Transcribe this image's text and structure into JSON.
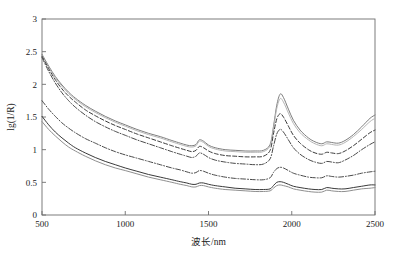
{
  "figure": {
    "background_color": "#ffffff",
    "axis_color": "#6e6e6e",
    "text_color": "#1b1b1b"
  },
  "chart_data": {
    "type": "line",
    "title": "",
    "subtitle": "",
    "xlabel": "波长/nm",
    "ylabel": "lg(1/R)",
    "xlim": [
      500,
      2500
    ],
    "ylim": [
      0,
      3
    ],
    "xticks": [
      500,
      1000,
      1500,
      2000,
      2500
    ],
    "xtick_labels": [
      "500",
      "1000",
      "1500",
      "2000",
      "2500"
    ],
    "yticks": [
      0,
      0.5,
      1,
      1.5,
      2,
      2.5,
      3
    ],
    "ytick_labels": [
      "0",
      "0.5",
      "1",
      "1.5",
      "2",
      "2.5",
      "3"
    ],
    "grid": false,
    "legend": null,
    "legend_position": "none",
    "annotations": [],
    "x": [
      500,
      540,
      580,
      620,
      660,
      700,
      760,
      820,
      880,
      940,
      1000,
      1070,
      1140,
      1210,
      1280,
      1330,
      1370,
      1400,
      1425,
      1445,
      1470,
      1500,
      1540,
      1600,
      1660,
      1720,
      1780,
      1830,
      1870,
      1890,
      1910,
      1930,
      1950,
      1980,
      2010,
      2050,
      2100,
      2140,
      2180,
      2210,
      2240,
      2280,
      2320,
      2370,
      2420,
      2470,
      2500
    ],
    "series": [
      {
        "name": "spectrum-1",
        "linestyle": "solid",
        "color": "#7d7d7d",
        "width": 1.0,
        "values": [
          2.46,
          2.28,
          2.12,
          1.99,
          1.88,
          1.79,
          1.68,
          1.59,
          1.51,
          1.44,
          1.38,
          1.31,
          1.25,
          1.2,
          1.14,
          1.1,
          1.07,
          1.06,
          1.08,
          1.15,
          1.13,
          1.07,
          1.03,
          1.0,
          0.99,
          0.98,
          0.98,
          0.99,
          1.08,
          1.35,
          1.68,
          1.85,
          1.8,
          1.62,
          1.45,
          1.3,
          1.18,
          1.12,
          1.09,
          1.12,
          1.11,
          1.1,
          1.14,
          1.23,
          1.35,
          1.48,
          1.53
        ]
      },
      {
        "name": "spectrum-2",
        "linestyle": "solid",
        "color": "#b6b6b6",
        "width": 1.0,
        "values": [
          2.44,
          2.26,
          2.1,
          1.97,
          1.86,
          1.77,
          1.66,
          1.57,
          1.49,
          1.42,
          1.36,
          1.29,
          1.23,
          1.18,
          1.12,
          1.08,
          1.05,
          1.04,
          1.06,
          1.13,
          1.11,
          1.05,
          1.01,
          0.98,
          0.97,
          0.96,
          0.96,
          0.97,
          1.06,
          1.32,
          1.63,
          1.78,
          1.73,
          1.56,
          1.4,
          1.26,
          1.15,
          1.09,
          1.06,
          1.09,
          1.08,
          1.07,
          1.11,
          1.2,
          1.31,
          1.43,
          1.48
        ]
      },
      {
        "name": "spectrum-3",
        "linestyle": "dashed",
        "color": "#3a3a3a",
        "width": 1.0,
        "values": [
          2.43,
          2.24,
          2.07,
          1.93,
          1.82,
          1.73,
          1.61,
          1.52,
          1.44,
          1.37,
          1.31,
          1.24,
          1.18,
          1.12,
          1.06,
          1.02,
          0.99,
          0.97,
          0.99,
          1.05,
          1.03,
          0.98,
          0.94,
          0.91,
          0.9,
          0.89,
          0.89,
          0.9,
          0.99,
          1.24,
          1.47,
          1.55,
          1.5,
          1.36,
          1.22,
          1.1,
          1.0,
          0.95,
          0.93,
          0.96,
          0.95,
          0.94,
          0.98,
          1.06,
          1.16,
          1.26,
          1.3
        ]
      },
      {
        "name": "spectrum-4",
        "linestyle": "dashdot",
        "color": "#4a4a4a",
        "width": 1.0,
        "values": [
          2.41,
          2.2,
          2.02,
          1.87,
          1.75,
          1.65,
          1.53,
          1.43,
          1.35,
          1.28,
          1.22,
          1.15,
          1.09,
          1.03,
          0.97,
          0.93,
          0.9,
          0.88,
          0.9,
          0.95,
          0.93,
          0.88,
          0.84,
          0.81,
          0.79,
          0.78,
          0.77,
          0.78,
          0.86,
          1.05,
          1.24,
          1.31,
          1.27,
          1.15,
          1.03,
          0.93,
          0.85,
          0.81,
          0.79,
          0.82,
          0.81,
          0.8,
          0.84,
          0.91,
          1.0,
          1.08,
          1.12
        ]
      },
      {
        "name": "spectrum-5",
        "linestyle": "dashdot",
        "color": "#4a4a4a",
        "width": 1.0,
        "values": [
          1.75,
          1.62,
          1.51,
          1.41,
          1.33,
          1.26,
          1.17,
          1.1,
          1.03,
          0.97,
          0.92,
          0.87,
          0.82,
          0.77,
          0.72,
          0.69,
          0.66,
          0.64,
          0.65,
          0.68,
          0.67,
          0.64,
          0.61,
          0.58,
          0.56,
          0.55,
          0.54,
          0.54,
          0.57,
          0.65,
          0.71,
          0.73,
          0.72,
          0.68,
          0.64,
          0.61,
          0.58,
          0.57,
          0.57,
          0.6,
          0.59,
          0.58,
          0.59,
          0.61,
          0.64,
          0.66,
          0.67
        ]
      },
      {
        "name": "spectrum-6",
        "linestyle": "solid",
        "color": "#3a3a3a",
        "width": 1.0,
        "values": [
          1.51,
          1.38,
          1.27,
          1.18,
          1.1,
          1.03,
          0.95,
          0.88,
          0.82,
          0.77,
          0.72,
          0.67,
          0.62,
          0.58,
          0.54,
          0.51,
          0.49,
          0.47,
          0.47,
          0.49,
          0.49,
          0.47,
          0.45,
          0.43,
          0.41,
          0.4,
          0.39,
          0.39,
          0.4,
          0.45,
          0.5,
          0.51,
          0.5,
          0.47,
          0.44,
          0.42,
          0.4,
          0.39,
          0.39,
          0.42,
          0.41,
          0.4,
          0.4,
          0.42,
          0.44,
          0.46,
          0.46
        ]
      },
      {
        "name": "spectrum-7",
        "linestyle": "solid",
        "color": "#8f8f8f",
        "width": 1.0,
        "values": [
          1.43,
          1.31,
          1.21,
          1.12,
          1.04,
          0.98,
          0.9,
          0.83,
          0.77,
          0.72,
          0.68,
          0.63,
          0.58,
          0.54,
          0.5,
          0.47,
          0.45,
          0.43,
          0.43,
          0.45,
          0.45,
          0.43,
          0.41,
          0.39,
          0.38,
          0.37,
          0.36,
          0.36,
          0.37,
          0.41,
          0.45,
          0.46,
          0.45,
          0.43,
          0.4,
          0.38,
          0.36,
          0.35,
          0.35,
          0.38,
          0.37,
          0.36,
          0.36,
          0.38,
          0.4,
          0.41,
          0.42
        ]
      }
    ]
  }
}
